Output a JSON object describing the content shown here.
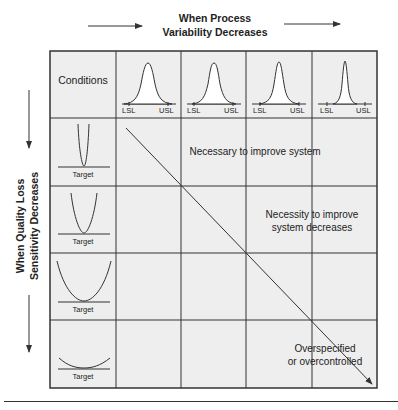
{
  "header": {
    "top_title_line1": "When Process",
    "top_title_line2": "Variability Decreases",
    "side_title_line1": "When Quality Loss",
    "side_title_line2": "Sensitivity Decreases"
  },
  "grid": {
    "corner_label": "Conditions",
    "columns": [
      {
        "lsl": "LSL",
        "usl": "USL",
        "spread": "widest"
      },
      {
        "lsl": "LSL",
        "usl": "USL",
        "spread": "wide"
      },
      {
        "lsl": "LSL",
        "usl": "USL",
        "spread": "narrow"
      },
      {
        "lsl": "LSL",
        "usl": "USL",
        "spread": "narrowest"
      }
    ],
    "rows": [
      {
        "label": "Target",
        "loss_curve": "steepest"
      },
      {
        "label": "Target",
        "loss_curve": "steep"
      },
      {
        "label": "Target",
        "loss_curve": "shallow"
      },
      {
        "label": "Target",
        "loss_curve": "flattest"
      }
    ]
  },
  "regions": {
    "region1": "Necessary to improve system",
    "region2_line1": "Necessity to improve",
    "region2_line2": "system decreases",
    "region3_line1": "Overspecified",
    "region3_line2": "or overcontrolled"
  },
  "colors": {
    "background": "#ffffff",
    "cell_fill": "#eeeeee",
    "line": "#333333"
  }
}
